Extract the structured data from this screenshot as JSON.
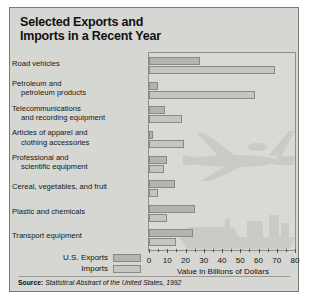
{
  "title_lines": [
    "Selected Exports and",
    "Imports in a Recent Year"
  ],
  "source": {
    "prefix": "Source:",
    "text": "Statistical Abstract of the United States, 1992"
  },
  "legend": {
    "exports_label": "U.S. Exports",
    "imports_label": "Imports"
  },
  "axis": {
    "title": "Value in Billions of Dollars",
    "ticks": [
      "0",
      "10",
      "20",
      "30",
      "40",
      "50",
      "60",
      "70",
      "80"
    ]
  },
  "colors": {
    "panel": "#d6d6d2",
    "plot": "#d9d9d5",
    "exports": "#b4b4ae",
    "imports": "#c6c6c0",
    "border": "#8a8a85",
    "text": "#111111"
  },
  "categories_display": [
    {
      "l1": "Road vehicles",
      "l2": ""
    },
    {
      "l1": "Petroleum and",
      "l2": "petroleum products"
    },
    {
      "l1": "Telecommunications",
      "l2": "and recording equipment"
    },
    {
      "l1": "Articles of apparel and",
      "l2": "clothing accessories"
    },
    {
      "l1": "Professional and",
      "l2": "scientific equipment"
    },
    {
      "l1": "Cereal, vegetables, and fruit",
      "l2": ""
    },
    {
      "l1": "Plastic and chemicals",
      "l2": ""
    },
    {
      "l1": "Transport equipment",
      "l2": ""
    }
  ],
  "chart_data": {
    "type": "bar",
    "title": "Selected Exports and Imports in a Recent Year",
    "orientation": "horizontal",
    "xlabel": "Value in Billions of Dollars",
    "ylabel": "",
    "xlim": [
      0,
      80
    ],
    "xticks": [
      0,
      10,
      20,
      30,
      40,
      50,
      60,
      70,
      80
    ],
    "grid": false,
    "legend_position": "bottom-left",
    "categories": [
      "Road vehicles",
      "Petroleum and petroleum products",
      "Telecommunications and recording equipment",
      "Articles of apparel and clothing accessories",
      "Professional and scientific equipment",
      "Cereal, vegetables, and fruit",
      "Plastic and chemicals",
      "Transport equipment"
    ],
    "series": [
      {
        "name": "U.S. Exports",
        "color": "#b4b4ae",
        "values": [
          28,
          5,
          9,
          2,
          10,
          14,
          25,
          24
        ]
      },
      {
        "name": "Imports",
        "color": "#c6c6c0",
        "values": [
          69,
          58,
          18,
          19,
          8,
          5,
          10,
          15
        ]
      }
    ]
  }
}
